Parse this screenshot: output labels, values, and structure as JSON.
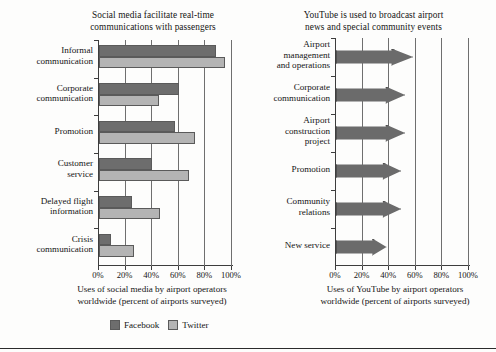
{
  "colors": {
    "facebook": "#6d6d6d",
    "twitter": "#b4b4b4",
    "youtube": "#6b6b6b",
    "axis": "#3d3d3d",
    "gridline": "#6f6f6f",
    "text": "#141414",
    "background": "#fdfdfc"
  },
  "legend": {
    "facebook_label": "Facebook",
    "twitter_label": "Twitter"
  },
  "left_panel": {
    "title_line1": "Social media facilitate real-time",
    "title_line2": "communications with passengers",
    "caption_line1": "Uses of social media by airport operators",
    "caption_line2": "worldwide (percent of airports surveyed)"
  },
  "right_panel": {
    "title_line1": "YouTube is used to broadcast airport",
    "title_line2": "news and special community events",
    "caption_line1": "Uses of YouTube by airport operators",
    "caption_line2": "worldwide (percent of airports surveyed)"
  },
  "chart_data": [
    {
      "id": "social-media-realtime",
      "type": "bar",
      "orientation": "horizontal",
      "title": "Social media facilitate real-time communications with passengers",
      "xlabel": "Uses of social media by airport operators worldwide (percent of airports surveyed)",
      "ylabel": "",
      "xlim": [
        0,
        100
      ],
      "xticks": [
        0,
        20,
        40,
        60,
        80,
        100
      ],
      "xticklabels": [
        "0%",
        "20%",
        "40%",
        "60%",
        "80%",
        "100%"
      ],
      "grid": true,
      "legend_position": "bottom-center",
      "categories": [
        "Informal communication",
        "Corporate communication",
        "Promotion",
        "Customer service",
        "Delayed flight information",
        "Crisis communication"
      ],
      "category_lines": [
        [
          "Informal",
          "communication"
        ],
        [
          "Corporate",
          "communication"
        ],
        [
          "Promotion"
        ],
        [
          "Customer",
          "service"
        ],
        [
          "Delayed flight",
          "information"
        ],
        [
          "Crisis",
          "communication"
        ]
      ],
      "series": [
        {
          "name": "Facebook",
          "color": "#6d6d6d",
          "values": [
            88,
            60,
            57,
            40,
            25,
            9
          ]
        },
        {
          "name": "Twitter",
          "color": "#b4b4b4",
          "values": [
            95,
            45,
            72,
            68,
            46,
            26
          ]
        }
      ]
    },
    {
      "id": "youtube-broadcast",
      "type": "bar",
      "orientation": "horizontal",
      "bar_shape": "cone-arrow",
      "title": "YouTube is used to broadcast airport news and special community events",
      "xlabel": "Uses of YouTube by airport operators worldwide (percent of airports surveyed)",
      "ylabel": "",
      "xlim": [
        0,
        100
      ],
      "xticks": [
        0,
        20,
        40,
        60,
        80,
        100
      ],
      "xticklabels": [
        "0%",
        "20%",
        "40%",
        "60%",
        "80%",
        "100%"
      ],
      "grid": true,
      "legend_position": "none",
      "categories": [
        "Airport management and operations",
        "Corporate communication",
        "Airport construction project",
        "Promotion",
        "Community relations",
        "New service"
      ],
      "category_lines": [
        [
          "Airport",
          "management",
          "and operations"
        ],
        [
          "Corporate",
          "communication"
        ],
        [
          "Airport",
          "construction",
          "project"
        ],
        [
          "Promotion"
        ],
        [
          "Community",
          "relations"
        ],
        [
          "New service"
        ]
      ],
      "series": [
        {
          "name": "YouTube",
          "color": "#6b6b6b",
          "values": [
            58,
            52,
            52,
            49,
            49,
            38
          ]
        }
      ]
    }
  ]
}
